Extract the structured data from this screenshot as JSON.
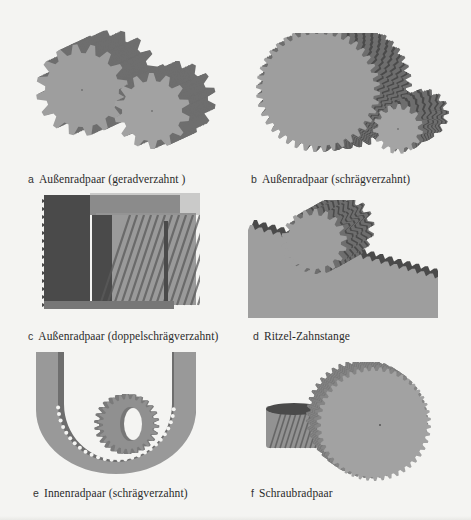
{
  "figure": {
    "panels": [
      {
        "letter": "a",
        "caption": "Außenradpaar (geradverzahnt )"
      },
      {
        "letter": "b",
        "caption": "Außenradpaar (schrägverzahnt)"
      },
      {
        "letter": "c",
        "caption": "Außenradpaar (doppelschrägverzahnt)"
      },
      {
        "letter": "d",
        "caption": "Ritzel-Zahnstange"
      },
      {
        "letter": "e",
        "caption": "Innenradpaar (schrägverzahnt)"
      },
      {
        "letter": "f",
        "caption": "Schraubradpaar"
      }
    ],
    "colors": {
      "gear_face": "#9e9e9e",
      "gear_side": "#6e6e6e",
      "gear_dark": "#4a4a4a",
      "background": "#f4f4f2",
      "text": "#2a2a2a"
    }
  }
}
